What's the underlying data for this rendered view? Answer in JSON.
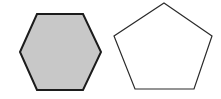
{
  "figure": {
    "background_color": "#ffffff",
    "width": 221,
    "height": 99,
    "caption": "",
    "shape_count": "2"
  },
  "shapes": [
    {
      "name": "hexagon",
      "label": "Hexagon",
      "sides": "6",
      "filled": "true",
      "fill_color": "#c8c8c8",
      "stroke_color": "#1c1c1c",
      "stroke_width": "2",
      "points": "20,52 37,14 83,14 101,52 83,90 37,90",
      "bounds": {
        "left": "20",
        "top": "14",
        "right": "101",
        "bottom": "90",
        "width": "81",
        "height": "76"
      },
      "vertices": [
        {
          "x": "20",
          "y": "52"
        },
        {
          "x": "37",
          "y": "14"
        },
        {
          "x": "83",
          "y": "14"
        },
        {
          "x": "101",
          "y": "52"
        },
        {
          "x": "83",
          "y": "90"
        },
        {
          "x": "37",
          "y": "90"
        }
      ]
    },
    {
      "name": "pentagon",
      "label": "Pentagon",
      "sides": "5",
      "filled": "false",
      "fill_color": "#ffffff",
      "stroke_color": "#2a2a2a",
      "stroke_width": "1.2",
      "points": "164,3 212,36 194,89 135,89 114,36",
      "bounds": {
        "left": "114",
        "top": "3",
        "right": "212",
        "bottom": "89",
        "width": "98",
        "height": "86"
      },
      "vertices": [
        {
          "x": "164",
          "y": "3"
        },
        {
          "x": "212",
          "y": "36"
        },
        {
          "x": "194",
          "y": "89"
        },
        {
          "x": "135",
          "y": "89"
        },
        {
          "x": "114",
          "y": "36"
        }
      ]
    }
  ]
}
